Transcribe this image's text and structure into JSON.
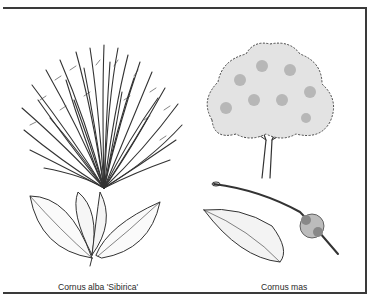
{
  "figure": {
    "panels": [
      {
        "id": "left",
        "caption": "Cornus alba 'Sibirica'",
        "illustrations": [
          "shrub-habit",
          "leaf-spray"
        ]
      },
      {
        "id": "right",
        "caption": "Cornus mas",
        "illustrations": [
          "tree-habit",
          "leaf",
          "flowering-twig"
        ]
      }
    ],
    "colors": {
      "ink": "#333333",
      "frame": "#3a3a3a",
      "background": "#ffffff"
    }
  }
}
